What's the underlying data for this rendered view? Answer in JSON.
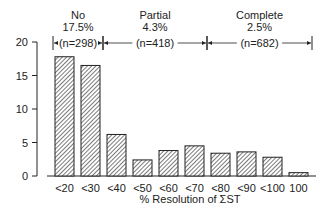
{
  "chart_data": {
    "type": "bar",
    "title": "",
    "xlabel": "% Resolution of ΣST",
    "ylabel": "",
    "ylim": [
      0,
      20
    ],
    "yticks": [
      0,
      5,
      10,
      15,
      20
    ],
    "grid": false,
    "categories": [
      "<20",
      "<30",
      "<40",
      "<50",
      "<60",
      "<70",
      "<80",
      "<90",
      "<100",
      "100"
    ],
    "values": [
      17.8,
      16.5,
      6.2,
      2.4,
      3.8,
      4.5,
      3.4,
      3.6,
      2.8,
      0.5
    ],
    "bar_fill": "diagonal-hatch",
    "annotations": [
      {
        "label": "No",
        "percent": "17.5%",
        "n": "(n=298)",
        "span": [
          "<20",
          "<30"
        ]
      },
      {
        "label": "Partial",
        "percent": "4.3%",
        "n": "(n=418)",
        "span": [
          "<40",
          "<70"
        ]
      },
      {
        "label": "Complete",
        "percent": "2.5%",
        "n": "(n=682)",
        "span": [
          "<80",
          "100"
        ]
      }
    ]
  },
  "colors": {
    "ink": "#222222",
    "background": "#ffffff"
  }
}
